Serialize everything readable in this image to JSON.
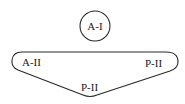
{
  "diagram": {
    "top_node": {
      "label": "A-I"
    },
    "group": {
      "labels": {
        "left": "A-II",
        "right": "P-II",
        "bottom": "P-II"
      }
    },
    "colors": {
      "stroke": "#2a2a2a",
      "text": "#1a1a1a",
      "background": "#ffffff"
    }
  }
}
